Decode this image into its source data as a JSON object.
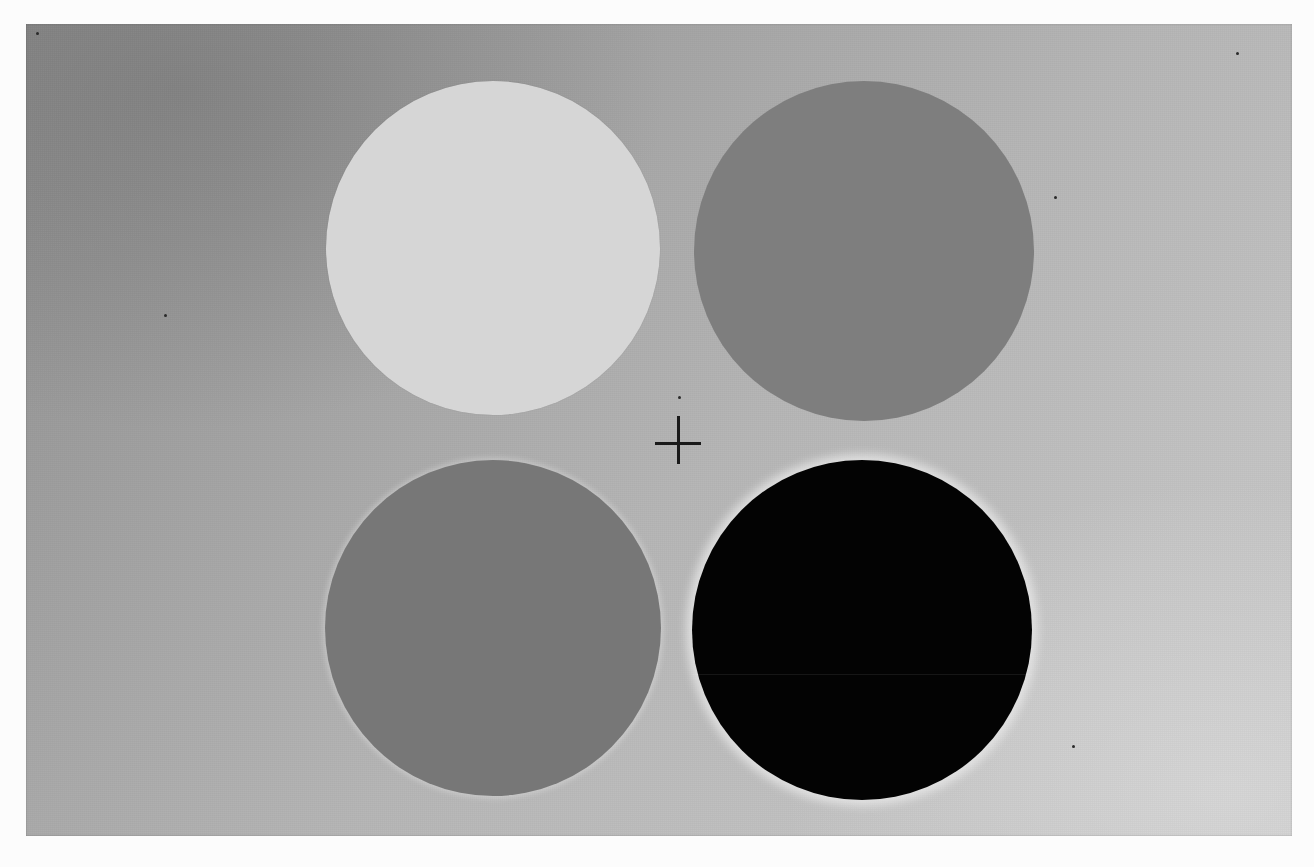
{
  "image": {
    "description": "Scanned plate of four uniform gray disks on a graded gray background with a central fixation cross (simultaneous brightness contrast stimulus)",
    "page_background": "#fcfcfc",
    "panel": {
      "x": 26,
      "y": 24,
      "width": 1266,
      "height": 812,
      "gradient_dark": "#8c8c8c",
      "gradient_light": "#c8c8c8",
      "gradient_direction": "upper-left dark to lower-right light"
    },
    "circles": [
      {
        "position": "top-left",
        "cx": 493,
        "cy": 248,
        "r": 167,
        "color": "#d6d6d6",
        "label": "light-gray"
      },
      {
        "position": "top-right",
        "cx": 864,
        "cy": 251,
        "r": 170,
        "color": "#7e7e7e",
        "label": "mid-gray"
      },
      {
        "position": "bottom-left",
        "cx": 493,
        "cy": 628,
        "r": 168,
        "color": "#777777",
        "label": "mid-gray"
      },
      {
        "position": "bottom-right",
        "cx": 862,
        "cy": 630,
        "r": 170,
        "color": "#030303",
        "label": "black"
      }
    ],
    "fixation_cross": {
      "cx": 678,
      "cy": 440,
      "arm_length_h": 46,
      "arm_length_v": 48,
      "thickness": 3,
      "color": "#1a1a1a"
    }
  }
}
